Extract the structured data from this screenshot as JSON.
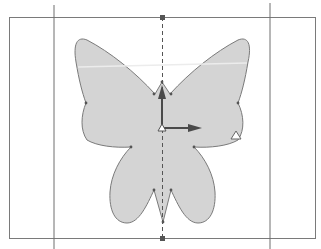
{
  "canvas": {
    "description": "Vector shape editor viewport showing a mirrored butterfly shape",
    "colors": {
      "background": "#ffffff",
      "shape_fill": "#d4d4d4",
      "shape_stroke": "#7a7a7a",
      "guide_line": "#6e6e6e",
      "axis_line": "#555555",
      "handle": "#555555",
      "gizmo": "#555555",
      "highlight_band": "#e6e6e6"
    }
  },
  "shape": {
    "name": "butterfly",
    "symmetric": true
  },
  "symmetry_axis": {
    "style": "dashed",
    "handles": [
      "top-handle",
      "bottom-handle"
    ]
  },
  "gizmo": {
    "axes": [
      "y-axis-up",
      "x-axis-right"
    ]
  },
  "icons": {
    "pivot": "triangle-marker-icon",
    "corner": "triangle-marker-icon"
  }
}
